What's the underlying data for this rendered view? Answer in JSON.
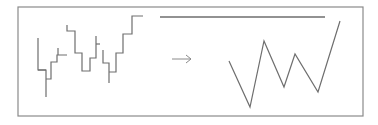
{
  "diagram": {
    "type": "transformation",
    "colors": {
      "background": "#ffffff",
      "frame": "#8a8a8a",
      "line": "#6e6e6e",
      "arrow": "#8a8a8a"
    },
    "frame": {
      "x": 18,
      "y": 7,
      "width": 345,
      "height": 109
    },
    "top_line": {
      "x1": 160,
      "y1": 17,
      "x2": 325,
      "y2": 17
    },
    "left_panel": {
      "name": "step-series",
      "segments": [
        [
          [
            38,
            38
          ],
          [
            38,
            70
          ],
          [
            46,
            70
          ],
          [
            46,
            97
          ]
        ],
        [
          [
            38,
            70
          ],
          [
            46,
            70
          ]
        ],
        [
          [
            46,
            79
          ],
          [
            51,
            79
          ],
          [
            51,
            62
          ],
          [
            57,
            62
          ],
          [
            57,
            55
          ],
          [
            67,
            55
          ]
        ],
        [
          [
            58,
            48
          ],
          [
            58,
            55
          ]
        ],
        [
          [
            67,
            25
          ],
          [
            67,
            31
          ],
          [
            75,
            31
          ],
          [
            75,
            53
          ],
          [
            82,
            53
          ],
          [
            82,
            71
          ],
          [
            90,
            71
          ],
          [
            90,
            58
          ],
          [
            96,
            58
          ],
          [
            96,
            36
          ]
        ],
        [
          [
            96,
            44
          ],
          [
            100,
            44
          ]
        ],
        [
          [
            103,
            50
          ],
          [
            103,
            63
          ],
          [
            109,
            63
          ],
          [
            109,
            83
          ]
        ],
        [
          [
            109,
            72
          ],
          [
            116,
            72
          ],
          [
            116,
            53
          ],
          [
            123,
            53
          ],
          [
            123,
            34
          ],
          [
            132,
            34
          ],
          [
            132,
            16
          ],
          [
            143,
            16
          ]
        ]
      ]
    },
    "arrow": {
      "x1": 172,
      "y1": 59,
      "x2": 191,
      "y2": 59,
      "glyph": "→"
    },
    "right_panel": {
      "name": "zigzag-series",
      "points": [
        [
          229,
          61
        ],
        [
          250,
          107
        ],
        [
          264,
          41
        ],
        [
          284,
          87
        ],
        [
          295,
          54
        ],
        [
          318,
          92
        ],
        [
          340,
          21
        ]
      ]
    }
  }
}
